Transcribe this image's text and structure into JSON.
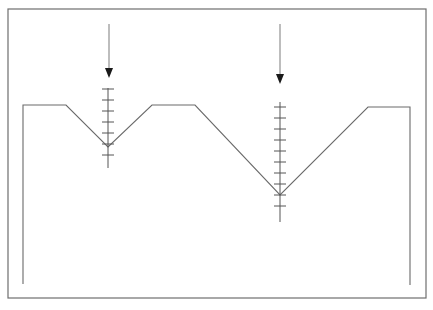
{
  "diagram": {
    "title": "",
    "description": "Profile with two V-shaped notches, each with a downward arrow and a graduated measurement scale",
    "colors": {
      "background": "#ffffff",
      "frame": "#6e6e6e",
      "profile": "#6a6a6a",
      "scale": "#555555",
      "arrow_shaft": "#9a9a9a",
      "arrow_head": "#1a1a1a"
    },
    "frame": {
      "x1": 8,
      "y1": 9,
      "x2": 426,
      "y2": 298
    },
    "profile_points": [
      [
        23,
        284
      ],
      [
        23,
        105
      ],
      [
        66,
        105
      ],
      [
        108,
        147
      ],
      [
        152,
        105
      ],
      [
        195,
        105
      ],
      [
        280,
        195
      ],
      [
        368,
        107
      ],
      [
        410,
        107
      ],
      [
        410,
        285
      ]
    ],
    "notches": [
      {
        "id": "notch-1",
        "tip": [
          108,
          147
        ],
        "arrow": {
          "x": 109,
          "y_start": 24,
          "y_tip": 78
        },
        "scale": {
          "x": 108,
          "y_top": 88,
          "y_bottom": 168,
          "ticks": [
            89,
            100,
            111,
            122,
            133,
            144,
            155
          ],
          "tick_half_width": 6
        }
      },
      {
        "id": "notch-2",
        "tip": [
          280,
          195
        ],
        "arrow": {
          "x": 280,
          "y_start": 24,
          "y_tip": 84
        },
        "scale": {
          "x": 280,
          "y_top": 102,
          "y_bottom": 222,
          "ticks": [
            107,
            118,
            129,
            140,
            151,
            162,
            173,
            184,
            195,
            206
          ],
          "tick_half_width": 6
        }
      }
    ]
  }
}
